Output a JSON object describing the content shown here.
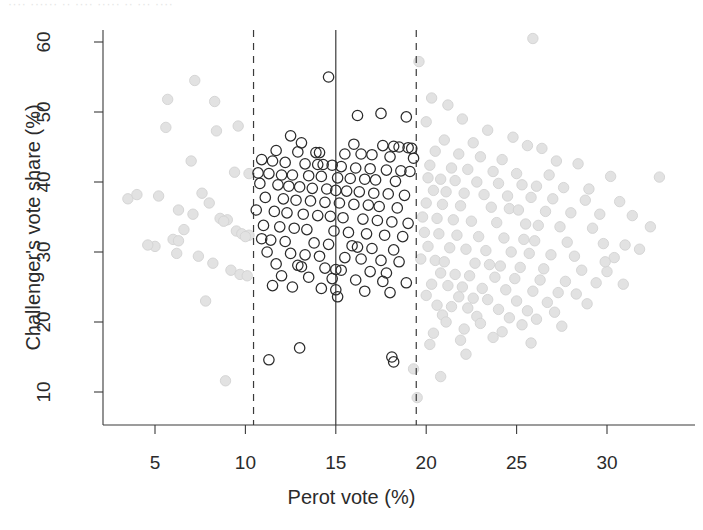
{
  "figure": {
    "top_artifact_text": "···· ······ ·· ···· ····· ·· ··· ····",
    "background_color": "#ffffff"
  },
  "chart_data": {
    "type": "scatter",
    "title": "",
    "xlabel": "Perot vote (%)",
    "ylabel": "Challenger's vote share (%)",
    "xlim": [
      2.6,
      33.8
    ],
    "ylim": [
      7.0,
      62.5
    ],
    "xticks": [
      5,
      10,
      15,
      20,
      25,
      30
    ],
    "yticks": [
      10,
      20,
      30,
      40,
      50,
      60
    ],
    "grid": false,
    "legend": "none",
    "reference_lines": [
      {
        "name": "lower-bandwidth-bound",
        "x": 10.45,
        "style": "dashed",
        "color": "#3a3a3a"
      },
      {
        "name": "cutpoint",
        "x": 15.0,
        "style": "solid",
        "color": "#3a3a3a"
      },
      {
        "name": "upper-bandwidth-bound",
        "x": 19.45,
        "style": "dashed",
        "color": "#3a3a3a"
      }
    ],
    "series": [
      {
        "name": "in-bandwidth",
        "marker": "open-circle",
        "color": "#2b2b2b",
        "points": [
          [
            14.6,
            55.0
          ],
          [
            17.5,
            49.8
          ],
          [
            16.2,
            49.5
          ],
          [
            18.9,
            49.3
          ],
          [
            12.5,
            46.6
          ],
          [
            13.1,
            45.6
          ],
          [
            16.0,
            45.4
          ],
          [
            17.6,
            45.2
          ],
          [
            18.2,
            45.1
          ],
          [
            18.5,
            45.0
          ],
          [
            19.0,
            44.9
          ],
          [
            19.2,
            44.8
          ],
          [
            11.7,
            44.5
          ],
          [
            12.9,
            44.3
          ],
          [
            13.9,
            44.2
          ],
          [
            14.1,
            44.2
          ],
          [
            15.5,
            44.0
          ],
          [
            16.4,
            44.0
          ],
          [
            17.0,
            43.9
          ],
          [
            18.0,
            43.6
          ],
          [
            19.3,
            43.4
          ],
          [
            10.9,
            43.2
          ],
          [
            11.5,
            43.0
          ],
          [
            12.2,
            42.8
          ],
          [
            13.3,
            42.6
          ],
          [
            14.0,
            42.5
          ],
          [
            14.3,
            42.5
          ],
          [
            14.8,
            42.4
          ],
          [
            15.3,
            42.2
          ],
          [
            16.1,
            42.0
          ],
          [
            16.9,
            41.9
          ],
          [
            17.8,
            41.7
          ],
          [
            18.6,
            41.6
          ],
          [
            19.1,
            41.5
          ],
          [
            10.7,
            41.3
          ],
          [
            11.3,
            41.2
          ],
          [
            12.0,
            41.0
          ],
          [
            12.6,
            41.0
          ],
          [
            13.5,
            40.9
          ],
          [
            14.2,
            40.8
          ],
          [
            15.1,
            40.6
          ],
          [
            15.8,
            40.5
          ],
          [
            16.6,
            40.4
          ],
          [
            17.2,
            40.3
          ],
          [
            18.3,
            40.1
          ],
          [
            10.8,
            39.8
          ],
          [
            11.8,
            39.6
          ],
          [
            12.4,
            39.4
          ],
          [
            13.0,
            39.3
          ],
          [
            13.7,
            39.1
          ],
          [
            14.5,
            39.0
          ],
          [
            15.0,
            38.8
          ],
          [
            15.6,
            38.7
          ],
          [
            16.3,
            38.6
          ],
          [
            17.1,
            38.4
          ],
          [
            17.9,
            38.3
          ],
          [
            18.8,
            38.1
          ],
          [
            11.1,
            37.8
          ],
          [
            12.1,
            37.6
          ],
          [
            12.8,
            37.4
          ],
          [
            13.6,
            37.3
          ],
          [
            14.4,
            37.1
          ],
          [
            15.2,
            37.0
          ],
          [
            16.0,
            36.8
          ],
          [
            16.8,
            36.7
          ],
          [
            17.4,
            36.5
          ],
          [
            18.4,
            36.3
          ],
          [
            10.6,
            36.0
          ],
          [
            11.6,
            35.8
          ],
          [
            12.3,
            35.6
          ],
          [
            13.2,
            35.4
          ],
          [
            14.0,
            35.2
          ],
          [
            14.7,
            35.1
          ],
          [
            15.4,
            34.9
          ],
          [
            16.5,
            34.7
          ],
          [
            17.3,
            34.5
          ],
          [
            18.1,
            34.3
          ],
          [
            19.0,
            34.1
          ],
          [
            11.0,
            33.8
          ],
          [
            11.9,
            33.6
          ],
          [
            12.7,
            33.4
          ],
          [
            13.4,
            33.2
          ],
          [
            14.9,
            33.0
          ],
          [
            15.7,
            32.8
          ],
          [
            16.7,
            32.6
          ],
          [
            17.7,
            32.4
          ],
          [
            18.7,
            32.2
          ],
          [
            10.9,
            31.9
          ],
          [
            11.4,
            31.7
          ],
          [
            12.2,
            31.5
          ],
          [
            13.8,
            31.3
          ],
          [
            14.6,
            31.1
          ],
          [
            15.9,
            30.9
          ],
          [
            16.2,
            30.7
          ],
          [
            17.0,
            30.5
          ],
          [
            18.2,
            30.3
          ],
          [
            11.2,
            30.0
          ],
          [
            12.5,
            29.8
          ],
          [
            13.3,
            29.6
          ],
          [
            14.1,
            29.4
          ],
          [
            15.5,
            29.2
          ],
          [
            16.4,
            29.0
          ],
          [
            17.5,
            28.8
          ],
          [
            18.5,
            28.6
          ],
          [
            11.7,
            28.3
          ],
          [
            12.9,
            28.1
          ],
          [
            13.1,
            27.9
          ],
          [
            14.4,
            27.7
          ],
          [
            15.0,
            27.5
          ],
          [
            15.3,
            27.4
          ],
          [
            16.9,
            27.2
          ],
          [
            17.8,
            27.0
          ],
          [
            12.0,
            26.6
          ],
          [
            13.5,
            26.4
          ],
          [
            14.8,
            26.2
          ],
          [
            16.1,
            26.0
          ],
          [
            17.6,
            25.8
          ],
          [
            18.9,
            25.6
          ],
          [
            11.5,
            25.2
          ],
          [
            12.6,
            25.0
          ],
          [
            14.2,
            24.8
          ],
          [
            15.0,
            24.6
          ],
          [
            15.1,
            23.6
          ],
          [
            16.6,
            24.4
          ],
          [
            18.0,
            24.2
          ],
          [
            13.0,
            16.3
          ],
          [
            18.1,
            15.0
          ],
          [
            18.2,
            14.3
          ],
          [
            11.3,
            14.6
          ]
        ]
      },
      {
        "name": "outside-bandwidth",
        "marker": "filled-circle",
        "color": "#e2e2e2",
        "points": [
          [
            25.9,
            60.5
          ],
          [
            7.2,
            54.5
          ],
          [
            5.7,
            51.8
          ],
          [
            8.3,
            51.5
          ],
          [
            19.6,
            57.2
          ],
          [
            9.6,
            48.0
          ],
          [
            5.6,
            47.8
          ],
          [
            8.4,
            47.3
          ],
          [
            20.3,
            52.0
          ],
          [
            21.2,
            51.0
          ],
          [
            22.0,
            49.0
          ],
          [
            20.0,
            48.6
          ],
          [
            23.4,
            47.4
          ],
          [
            24.8,
            46.4
          ],
          [
            21.0,
            46.0
          ],
          [
            22.6,
            45.6
          ],
          [
            25.6,
            45.2
          ],
          [
            26.4,
            44.8
          ],
          [
            20.5,
            44.4
          ],
          [
            21.8,
            44.0
          ],
          [
            23.0,
            43.6
          ],
          [
            24.2,
            43.2
          ],
          [
            27.2,
            43.0
          ],
          [
            28.4,
            42.6
          ],
          [
            20.2,
            42.4
          ],
          [
            21.4,
            42.0
          ],
          [
            22.3,
            41.8
          ],
          [
            23.7,
            41.5
          ],
          [
            25.0,
            41.2
          ],
          [
            26.8,
            41.0
          ],
          [
            30.2,
            40.8
          ],
          [
            32.9,
            40.7
          ],
          [
            7.0,
            43.0
          ],
          [
            9.4,
            41.4
          ],
          [
            10.2,
            41.2
          ],
          [
            20.1,
            40.6
          ],
          [
            20.8,
            40.4
          ],
          [
            21.6,
            40.2
          ],
          [
            22.8,
            40.0
          ],
          [
            24.0,
            39.8
          ],
          [
            25.3,
            39.6
          ],
          [
            26.1,
            39.4
          ],
          [
            27.6,
            39.2
          ],
          [
            29.0,
            39.0
          ],
          [
            20.4,
            38.8
          ],
          [
            21.1,
            38.6
          ],
          [
            22.1,
            38.4
          ],
          [
            23.2,
            38.2
          ],
          [
            24.5,
            38.0
          ],
          [
            25.8,
            37.8
          ],
          [
            27.0,
            37.6
          ],
          [
            28.8,
            37.4
          ],
          [
            30.7,
            37.2
          ],
          [
            20.0,
            37.0
          ],
          [
            20.9,
            36.8
          ],
          [
            21.9,
            36.6
          ],
          [
            23.6,
            36.4
          ],
          [
            24.6,
            36.2
          ],
          [
            25.1,
            36.0
          ],
          [
            26.6,
            35.8
          ],
          [
            28.0,
            35.6
          ],
          [
            29.6,
            35.4
          ],
          [
            31.4,
            35.2
          ],
          [
            19.8,
            35.0
          ],
          [
            20.6,
            34.8
          ],
          [
            21.5,
            34.6
          ],
          [
            22.5,
            34.4
          ],
          [
            23.9,
            34.2
          ],
          [
            25.5,
            34.0
          ],
          [
            26.2,
            33.8
          ],
          [
            27.4,
            33.6
          ],
          [
            29.2,
            33.4
          ],
          [
            7.6,
            38.4
          ],
          [
            5.2,
            38.0
          ],
          [
            8.0,
            37.0
          ],
          [
            6.3,
            36.0
          ],
          [
            7.1,
            35.4
          ],
          [
            8.6,
            34.8
          ],
          [
            9.0,
            34.6
          ],
          [
            8.8,
            34.4
          ],
          [
            6.6,
            33.2
          ],
          [
            9.5,
            33.0
          ],
          [
            9.8,
            32.6
          ],
          [
            10.2,
            32.4
          ],
          [
            10.0,
            32.2
          ],
          [
            6.0,
            31.8
          ],
          [
            6.3,
            31.6
          ],
          [
            19.9,
            32.8
          ],
          [
            20.7,
            32.6
          ],
          [
            21.7,
            32.4
          ],
          [
            22.9,
            32.2
          ],
          [
            24.3,
            32.0
          ],
          [
            25.4,
            31.8
          ],
          [
            26.0,
            31.6
          ],
          [
            27.8,
            31.4
          ],
          [
            29.8,
            31.2
          ],
          [
            31.0,
            31.0
          ],
          [
            20.1,
            30.8
          ],
          [
            21.3,
            30.6
          ],
          [
            22.2,
            30.4
          ],
          [
            23.3,
            30.2
          ],
          [
            24.7,
            30.0
          ],
          [
            25.7,
            29.8
          ],
          [
            26.9,
            29.6
          ],
          [
            28.2,
            29.4
          ],
          [
            30.4,
            29.2
          ],
          [
            19.7,
            29.0
          ],
          [
            20.5,
            28.8
          ],
          [
            21.0,
            28.6
          ],
          [
            22.7,
            28.4
          ],
          [
            23.5,
            28.2
          ],
          [
            24.1,
            28.0
          ],
          [
            25.2,
            27.8
          ],
          [
            26.5,
            27.6
          ],
          [
            28.6,
            27.4
          ],
          [
            30.0,
            27.2
          ],
          [
            20.8,
            27.0
          ],
          [
            21.6,
            26.8
          ],
          [
            22.4,
            26.6
          ],
          [
            23.8,
            26.4
          ],
          [
            24.9,
            26.2
          ],
          [
            26.3,
            26.0
          ],
          [
            27.7,
            25.8
          ],
          [
            29.4,
            25.6
          ],
          [
            20.3,
            25.4
          ],
          [
            21.2,
            25.2
          ],
          [
            22.0,
            25.0
          ],
          [
            23.1,
            24.8
          ],
          [
            24.4,
            24.6
          ],
          [
            25.9,
            24.4
          ],
          [
            27.3,
            24.2
          ],
          [
            28.3,
            24.0
          ],
          [
            20.0,
            23.8
          ],
          [
            21.8,
            23.6
          ],
          [
            22.6,
            23.4
          ],
          [
            23.4,
            23.2
          ],
          [
            25.0,
            23.0
          ],
          [
            26.7,
            22.8
          ],
          [
            28.9,
            22.6
          ],
          [
            20.6,
            22.4
          ],
          [
            21.4,
            22.2
          ],
          [
            22.3,
            22.0
          ],
          [
            24.0,
            21.8
          ],
          [
            25.6,
            21.6
          ],
          [
            27.1,
            21.4
          ],
          [
            20.9,
            21.0
          ],
          [
            22.8,
            20.8
          ],
          [
            24.6,
            20.6
          ],
          [
            26.1,
            20.4
          ],
          [
            21.1,
            20.0
          ],
          [
            23.0,
            19.8
          ],
          [
            25.3,
            19.6
          ],
          [
            27.5,
            19.4
          ],
          [
            22.1,
            19.0
          ],
          [
            24.2,
            18.6
          ],
          [
            20.4,
            18.4
          ],
          [
            23.7,
            17.8
          ],
          [
            21.9,
            17.4
          ],
          [
            25.8,
            17.0
          ],
          [
            6.2,
            29.8
          ],
          [
            7.4,
            29.4
          ],
          [
            8.2,
            28.4
          ],
          [
            9.2,
            27.4
          ],
          [
            9.7,
            26.8
          ],
          [
            10.1,
            26.6
          ],
          [
            5.0,
            30.8
          ],
          [
            4.6,
            31.0
          ],
          [
            3.5,
            37.6
          ],
          [
            4.0,
            38.2
          ],
          [
            7.8,
            23.0
          ],
          [
            8.9,
            11.6
          ],
          [
            19.3,
            13.3
          ],
          [
            20.8,
            12.2
          ],
          [
            22.2,
            15.4
          ],
          [
            19.5,
            9.2
          ],
          [
            20.2,
            16.8
          ],
          [
            29.9,
            28.6
          ],
          [
            31.8,
            30.4
          ],
          [
            30.9,
            25.4
          ],
          [
            32.4,
            33.6
          ]
        ]
      }
    ]
  }
}
